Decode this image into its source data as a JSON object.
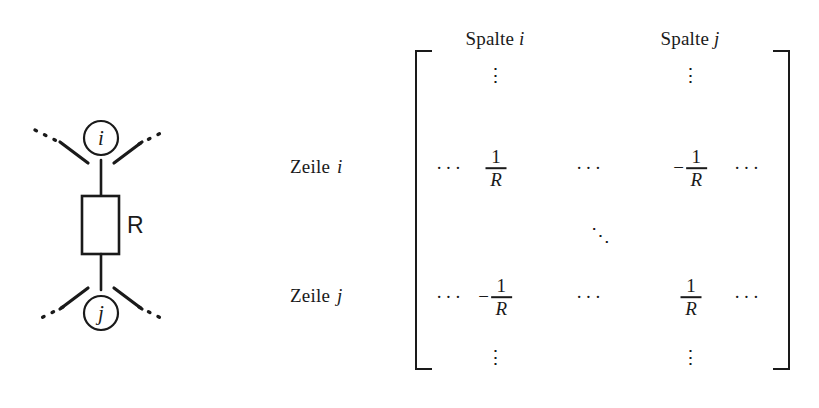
{
  "figure": {
    "circuit": {
      "node_top_label": "i",
      "node_bottom_label": "j",
      "component_label": "R",
      "component_type": "resistor"
    },
    "matrix": {
      "column_headers": [
        {
          "text": "Spalte",
          "index": "i"
        },
        {
          "text": "Spalte",
          "index": "j"
        }
      ],
      "row_headers": [
        {
          "text": "Zeile",
          "index": "i"
        },
        {
          "text": "Zeile",
          "index": "j"
        }
      ],
      "ellipsis_horizontal": "···",
      "ellipsis_vertical": "⋮",
      "ellipsis_diagonal": "⋱",
      "entries": {
        "row_i": [
          {
            "type": "hdots"
          },
          {
            "type": "fraction",
            "sign": "",
            "numerator": "1",
            "denominator": "R"
          },
          {
            "type": "hdots"
          },
          {
            "type": "fraction",
            "sign": "−",
            "numerator": "1",
            "denominator": "R"
          },
          {
            "type": "hdots"
          }
        ],
        "row_j": [
          {
            "type": "hdots"
          },
          {
            "type": "fraction",
            "sign": "−",
            "numerator": "1",
            "denominator": "R"
          },
          {
            "type": "hdots"
          },
          {
            "type": "fraction",
            "sign": "",
            "numerator": "1",
            "denominator": "R"
          },
          {
            "type": "hdots"
          }
        ]
      },
      "top_vdots": [
        "⋮",
        "⋮"
      ],
      "bottom_vdots": [
        "⋮",
        "⋮"
      ]
    },
    "colors": {
      "ink": "#1a1a1a",
      "background": "#ffffff"
    }
  }
}
